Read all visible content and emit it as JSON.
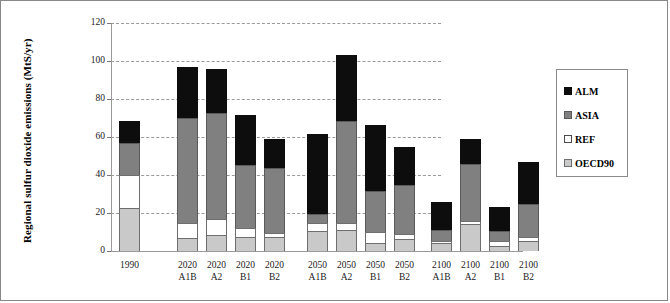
{
  "chart_data": {
    "type": "bar",
    "stacked": true,
    "title": "",
    "xlabel": "",
    "ylabel": "Regional sulfur dioxide emissions (MtS/yr)",
    "ylim": [
      0,
      120
    ],
    "yticks": [
      0,
      20,
      40,
      60,
      80,
      100,
      120
    ],
    "grid": "horizontal-dashed",
    "legend_position": "right",
    "categories": [
      {
        "year": "1990",
        "scenario": ""
      },
      {
        "year": "2020",
        "scenario": "A1B"
      },
      {
        "year": "2020",
        "scenario": "A2"
      },
      {
        "year": "2020",
        "scenario": "B1"
      },
      {
        "year": "2020",
        "scenario": "B2"
      },
      {
        "year": "2050",
        "scenario": "A1B"
      },
      {
        "year": "2050",
        "scenario": "A2"
      },
      {
        "year": "2050",
        "scenario": "B1"
      },
      {
        "year": "2050",
        "scenario": "B2"
      },
      {
        "year": "2100",
        "scenario": "A1B"
      },
      {
        "year": "2100",
        "scenario": "A2"
      },
      {
        "year": "2100",
        "scenario": "B1"
      },
      {
        "year": "2100",
        "scenario": "B2"
      }
    ],
    "series": [
      {
        "name": "OECD90",
        "color": "#c9c9c9",
        "values": [
          22.5,
          7.0,
          8.5,
          7.5,
          7.5,
          10.5,
          11.0,
          4.0,
          6.5,
          4.0,
          14.0,
          2.5,
          5.5
        ]
      },
      {
        "name": "REF",
        "color": "#ffffff",
        "values": [
          17.5,
          8.0,
          8.5,
          4.5,
          2.0,
          4.5,
          4.0,
          6.0,
          2.5,
          1.5,
          2.0,
          3.0,
          2.0
        ]
      },
      {
        "name": "ASIA",
        "color": "#808080",
        "values": [
          17.0,
          55.0,
          55.5,
          33.5,
          34.0,
          4.5,
          53.5,
          21.5,
          26.0,
          5.5,
          30.0,
          5.0,
          17.5
        ]
      },
      {
        "name": "ALM",
        "color": "#0d0d0d",
        "values": [
          11.5,
          27.0,
          23.5,
          26.0,
          15.5,
          42.0,
          34.5,
          35.0,
          19.5,
          15.0,
          13.0,
          12.5,
          22.0
        ]
      }
    ],
    "totals": [
      68.5,
      97.0,
      96.0,
      71.5,
      59.0,
      61.5,
      103.0,
      66.5,
      54.5,
      26.0,
      59.0,
      23.0,
      47.0
    ],
    "legend_entries": [
      "ALM",
      "ASIA",
      "REF",
      "OECD90"
    ]
  },
  "legend": {
    "items": [
      {
        "label": "ALM",
        "key": "ALM"
      },
      {
        "label": "ASIA",
        "key": "ASIA"
      },
      {
        "label": "REF",
        "key": "REF"
      },
      {
        "label": "OECD90",
        "key": "OECD90"
      }
    ]
  }
}
